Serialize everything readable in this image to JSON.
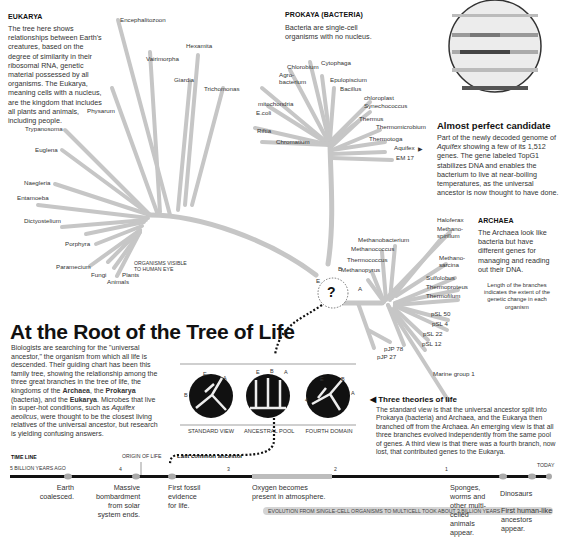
{
  "headline": "At the Root of the Tree of Life",
  "intro": {
    "text_parts": [
      "Biologists are searching for the \"universal ancestor,\" the organism from which all life is descended. Their guiding chart has been this family tree, showing the relationship among the three great branches in the tree of life, the kingdoms of the ",
      "Archaea",
      ", the ",
      "Prokarya",
      " (bacteria), and the ",
      "Eukarya",
      ". Microbes that live in super-hot conditions, such as ",
      "Aquifex aeolicus",
      ", were thought to be the closest living relatives of the universal ancestor, but research is yielding confusing answers."
    ]
  },
  "eukarya": {
    "title": "EUKARYA",
    "text": "The tree here shows relationships between Earth's creatures, based on the degree of similarity in their ribosomal RNA, genetic material possessed by all organisms. The Eukarya, meaning cells with a nucleus, are the kingdom that includes all plants and animals, including people.",
    "organisms": [
      "Encephalitozoon",
      "Vairimorpha",
      "Hexamita",
      "Giardia",
      "Trichomonas",
      "Physarum",
      "Trypanosoma",
      "Euglena",
      "Naegleria",
      "Entamoeba",
      "Dictyostelium",
      "Porphyra",
      "Paramecium",
      "Fungi",
      "Animals",
      "Plants"
    ],
    "visible_note": "ORGANISMS VISIBLE TO HUMAN EYE"
  },
  "prokarya": {
    "title": "PROKAYA (BACTERIA)",
    "text": "Bacteria are single-cell organisms with no nucleus.",
    "organisms": [
      "Chlorobium",
      "Cytophaga",
      "Agro-bacterium",
      "Epulopiscium",
      "Bacillus",
      "chloroplast",
      "Synechococcus",
      "mitochondria",
      "E.coli",
      "Riftia",
      "Chromatium",
      "Thermus",
      "Thermomicrobium",
      "Thermotoga",
      "Aquifex",
      "EM 17"
    ]
  },
  "archaea": {
    "title": "ARCHAEA",
    "text": "The Archaea look like bacteria but have different genes for managing and reading out their DNA.",
    "organisms": [
      "Haloferax",
      "Methano-spirillum",
      "Methano-sarcina",
      "Methanobacterium",
      "Methanococcus",
      "Thermococcus",
      "Methanopyrus",
      "Sulfolobus",
      "Thermoproteus",
      "Thermofilum",
      "pSL 50",
      "pSL 4",
      "pSL 22",
      "pSL 12",
      "pJP 78",
      "pJP 27",
      "Marine group 1"
    ],
    "branch_note": "Length of the branches indicates the extent of the genetic change in each organism"
  },
  "root": {
    "symbol": "?",
    "labels": {
      "E": "E",
      "B": "B",
      "A": "A"
    }
  },
  "candidate": {
    "title": "Almost perfect candidate",
    "text_parts": [
      "Part of the newly decoded genome of ",
      "Aquifex",
      " showing a few of its 1,512 genes. The gene labeled TopG1 stabilizes DNA and enables the bacterium to live at near-boiling temperatures, as the universal ancestor is now thought to have done."
    ]
  },
  "theories": {
    "title": "Three theories of life",
    "text": "The standard view is that the universal ancestor split into Prokarya (bacteria) and Archaea, and the Eukarya then branched off from the Archaea. An emerging view is that all three branches evolved independently from the same pool of genes. A third view is that there was a fourth branch, now lost, that contributed genes to the Eukarya.",
    "views": [
      {
        "caption": "STANDARD VIEW",
        "labels": [
          "E",
          "B",
          "A"
        ]
      },
      {
        "caption": "ANCESTRAL POOL",
        "labels": [
          "E",
          "B",
          "A"
        ]
      },
      {
        "caption": "FOURTH DOMAIN",
        "labels": [
          "4",
          "E",
          "B",
          "A"
        ]
      }
    ]
  },
  "timeline": {
    "title": "TIME LINE",
    "start_label": "5 BILLION YEARS AGO",
    "origin_label": "ORIGIN OF LIFE",
    "lca_label": "Last common ancestor",
    "today_label": "TODAY",
    "ticks": [
      "4",
      "3",
      "2",
      "1"
    ],
    "events": [
      {
        "text": "Earth coalesced."
      },
      {
        "text": "Massive bombardment from solar system ends."
      },
      {
        "text": "First fossil evidence for life."
      },
      {
        "text": "Oxygen becomes present in atmosphere."
      },
      {
        "text": "Sponges, worms and other multi-celled animals appear."
      },
      {
        "text": "Dinosaurs"
      },
      {
        "text": "First human-like ancestors appear."
      }
    ],
    "evolution_bar": "EVOLUTION FROM SINGLE-CELL ORGANISMS TO MULTICELL TOOK ABOUT 3 BILLION YEARS"
  },
  "colors": {
    "branch": "#c4c4c4",
    "branch_dark": "#a9a9a9",
    "text": "#222222",
    "circle_fill": "#111111",
    "timeline_bar": "#111111",
    "oxygen_bar": "#bdbdbd"
  }
}
